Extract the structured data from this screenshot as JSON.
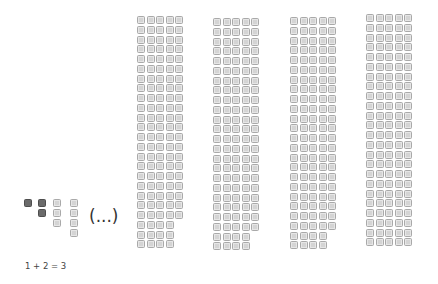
{
  "diagram": {
    "small_figure": {
      "columns": [
        {
          "count": 1,
          "style": "dark",
          "x": 24
        },
        {
          "count": 2,
          "style": "dark",
          "x": 38
        },
        {
          "count": 3,
          "style": "light",
          "x": 53
        },
        {
          "count": 4,
          "style": "light",
          "x": 70
        }
      ],
      "top": 199,
      "pitch": 10,
      "size": 8
    },
    "ellipsis_label": "(...)",
    "equation_label": "1 + 2 = 3",
    "big_columns": [
      {
        "x": 137,
        "top": 16,
        "width_cells": 5,
        "full_rows": 21,
        "partial_rows": 3,
        "partial_width": 4
      },
      {
        "x": 213,
        "top": 18,
        "width_cells": 5,
        "full_rows": 22,
        "partial_rows": 2,
        "partial_width": 4
      },
      {
        "x": 290,
        "top": 17,
        "width_cells": 5,
        "full_rows": 22,
        "partial_rows": 2,
        "partial_width": 4
      },
      {
        "x": 366,
        "top": 14,
        "width_cells": 5,
        "full_rows": 24,
        "partial_rows": 0,
        "partial_width": 0
      }
    ],
    "cell_pitch_x": 9.6,
    "cell_pitch_y": 9.75,
    "cell_size": 8,
    "colors": {
      "light_fill": "#d4d4d4",
      "light_border": "#a9a9a9",
      "dark_fill": "#6a6a6a"
    }
  }
}
